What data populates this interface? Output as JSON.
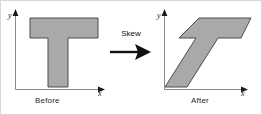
{
  "figure": {
    "width": 262,
    "height": 115,
    "background": "#ffffff",
    "border_color": "#d8d8d8"
  },
  "style": {
    "shape_fill": "#a9a9a9",
    "shape_stroke": "#4d4d4d",
    "axis_color": "#808080",
    "arrow_color": "#111111",
    "text_color": "#2b2b2b"
  },
  "transition": {
    "label": "Skew",
    "arrow_icon": "right-arrow-icon"
  },
  "panels": [
    {
      "id": "before",
      "caption": "Before",
      "axes": {
        "x_label": "x",
        "y_label": "y"
      },
      "shape": {
        "name": "T-shape",
        "points": "29,17 97,17 97,37 67,37 67,86 47,86 47,37 29,37"
      }
    },
    {
      "id": "after",
      "caption": "After",
      "axes": {
        "x_label": "x",
        "y_label": "y"
      },
      "shape": {
        "name": "skewed-T-shape",
        "points": "46,17 98,17 88,37 65,37 34,86 12,86 43,37 26,37"
      }
    }
  ]
}
